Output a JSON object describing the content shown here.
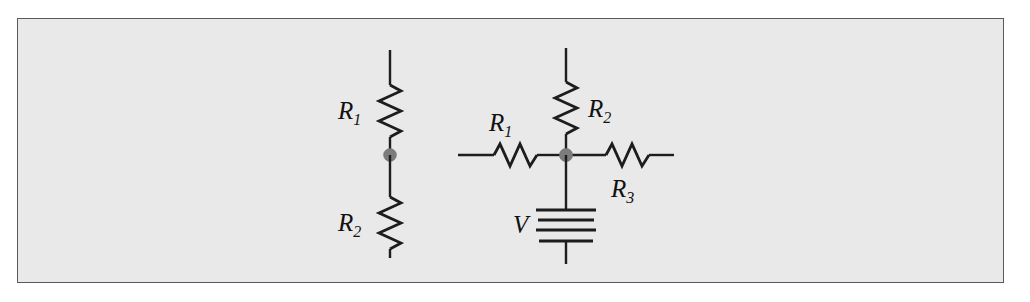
{
  "figure": {
    "kind": "electrical-circuit-diagram",
    "panel": {
      "background_color": "#e9e9e9",
      "border_color": "#5a5a5a",
      "page_background": "#ffffff"
    },
    "ink_color": "#1d1d1d",
    "node_dot_color": "#7c7c7c"
  },
  "circuits": [
    {
      "id": "left-circuit",
      "name": "series-resistor-pair",
      "orientation": "vertical",
      "components": [
        {
          "id": "left-r1",
          "type": "resistor",
          "label": "R",
          "subscript": "1",
          "label_position": "left",
          "orientation": "vertical"
        },
        {
          "id": "left-junction",
          "type": "junction-node",
          "label": "",
          "subscript": ""
        },
        {
          "id": "left-r2",
          "type": "resistor",
          "label": "R",
          "subscript": "2",
          "label_position": "left",
          "orientation": "vertical"
        }
      ]
    },
    {
      "id": "right-circuit",
      "name": "three-branch-node-with-source",
      "orientation": "mixed",
      "components": [
        {
          "id": "right-r2",
          "type": "resistor",
          "label": "R",
          "subscript": "2",
          "label_position": "right",
          "orientation": "vertical"
        },
        {
          "id": "right-r1",
          "type": "resistor",
          "label": "R",
          "subscript": "1",
          "label_position": "above",
          "orientation": "horizontal"
        },
        {
          "id": "right-r3",
          "type": "resistor",
          "label": "R",
          "subscript": "3",
          "label_position": "below",
          "orientation": "horizontal"
        },
        {
          "id": "right-junction",
          "type": "junction-node",
          "label": "",
          "subscript": ""
        },
        {
          "id": "voltage-source",
          "type": "battery",
          "label": "V",
          "subscript": "",
          "label_position": "left",
          "orientation": "vertical",
          "plate_count": 4
        }
      ]
    }
  ]
}
